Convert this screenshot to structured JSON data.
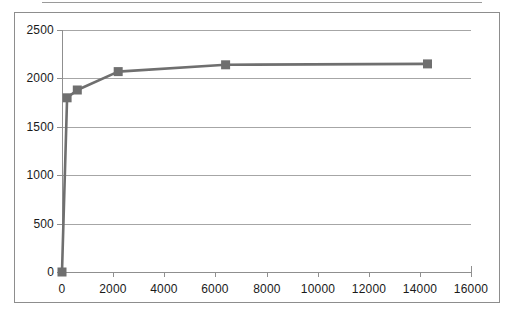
{
  "chart_data": {
    "type": "line",
    "title": "",
    "subtitle": "",
    "xlabel": "",
    "ylabel": "",
    "xlim": [
      0,
      16000
    ],
    "ylim": [
      0,
      2500
    ],
    "grid": true,
    "legend": "none",
    "xticks": [
      "0",
      "2000",
      "4000",
      "6000",
      "8000",
      "10000",
      "12000",
      "14000",
      "16000"
    ],
    "xtick_values": [
      0,
      2000,
      4000,
      6000,
      8000,
      10000,
      12000,
      14000,
      16000
    ],
    "yticks": [
      "0",
      "500",
      "1000",
      "1500",
      "2000",
      "2500"
    ],
    "ytick_values": [
      0,
      500,
      1000,
      1500,
      2000,
      2500
    ],
    "series": [
      {
        "name": "series-1",
        "color": "#6f6f6f",
        "marker": "square",
        "x": [
          0,
          200,
          600,
          2200,
          6400,
          14300
        ],
        "y": [
          0,
          1800,
          1880,
          2070,
          2140,
          2150
        ],
        "points": [
          {
            "x": 0,
            "y": 0
          },
          {
            "x": 200,
            "y": 1800
          },
          {
            "x": 600,
            "y": 1880
          },
          {
            "x": 2200,
            "y": 2070
          },
          {
            "x": 6400,
            "y": 2140
          },
          {
            "x": 14300,
            "y": 2150
          }
        ]
      }
    ]
  },
  "colors": {
    "series": "#6f6f6f",
    "gridline": "#a6a6a6",
    "axis": "#8f8f8f",
    "frame": "#8d8d8d",
    "text": "#1a1a1a",
    "background": "#ffffff"
  }
}
